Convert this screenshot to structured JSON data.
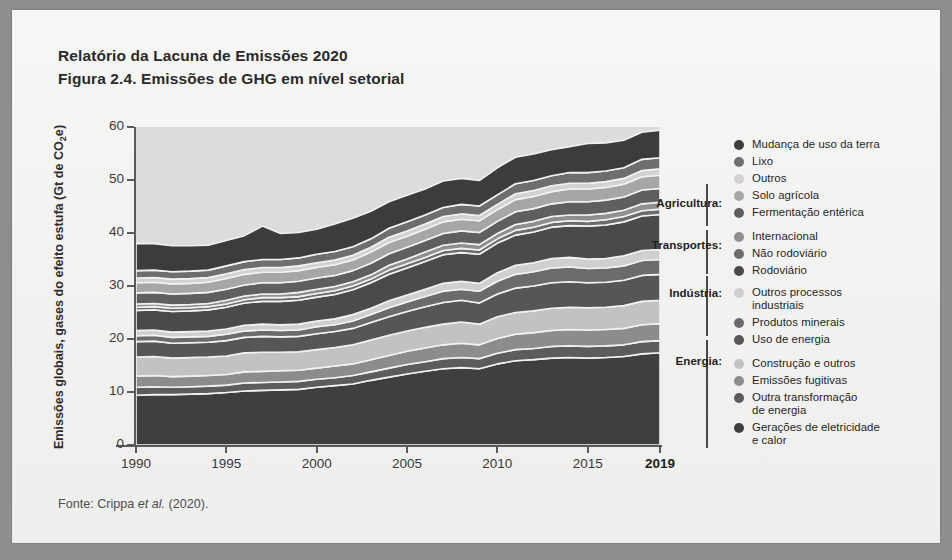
{
  "document": {
    "title_line1": "Relatório da Lacuna de Emissões 2020",
    "title_line2": "Figura 2.4. Emissões de GHG em nível setorial",
    "source_prefix": "Fonte: Crippa ",
    "source_italic": "et al.",
    "source_suffix": " (2020)."
  },
  "axis": {
    "ylabel_main": "Emissões globais, gases do efeito estufa (Gt de CO",
    "ylabel_sub": "2",
    "ylabel_tail": "e)",
    "yticks": [
      "0",
      "10",
      "20",
      "30",
      "40",
      "50",
      "60"
    ],
    "xticks": [
      {
        "label": "1990",
        "bold": false
      },
      {
        "label": "1995",
        "bold": false
      },
      {
        "label": "2000",
        "bold": false
      },
      {
        "label": "2005",
        "bold": false
      },
      {
        "label": "2010",
        "bold": false
      },
      {
        "label": "2015",
        "bold": false
      },
      {
        "label": "2019",
        "bold": true
      }
    ]
  },
  "legend": {
    "groups": [
      {
        "label": "Agricultura:",
        "top": 70,
        "bracket_top": 58,
        "bracket_height": 42
      },
      {
        "label": "Transportes:",
        "top": 112,
        "bracket_top": 104,
        "bracket_height": 44
      },
      {
        "label": "Indústria:",
        "top": 160,
        "bracket_top": 150,
        "bracket_height": 60
      },
      {
        "label": "Energia:",
        "top": 228,
        "bracket_top": 214,
        "bracket_height": 108
      }
    ],
    "items": [
      {
        "label": "Mudança de uso da terra",
        "color": "#3c3c3c",
        "top": 12
      },
      {
        "label": "Lixo",
        "color": "#6e6e6e",
        "top": 29
      },
      {
        "label": "Outros",
        "color": "#d2d2d2",
        "top": 46
      },
      {
        "label": "Solo agrícola",
        "color": "#a6a6a6",
        "top": 63
      },
      {
        "label": "Fermentação entérica",
        "color": "#5f5f5f",
        "top": 80
      },
      {
        "label": "Internacional",
        "color": "#8f8f8f",
        "top": 104
      },
      {
        "label": "Não rodoviário",
        "color": "#6b6b6b",
        "top": 121
      },
      {
        "label": "Rodoviário",
        "color": "#4a4a4a",
        "top": 138
      },
      {
        "label": "Outros processos\nindustriais",
        "color": "#cfcfcf",
        "top": 160
      },
      {
        "label": "Produtos minerais",
        "color": "#6b6b6b",
        "top": 190
      },
      {
        "label": "Uso de energia",
        "color": "#565656",
        "top": 207
      },
      {
        "label": "Construção e outros",
        "color": "#c2c2c2",
        "top": 231
      },
      {
        "label": "Emissões fugitivas",
        "color": "#8c8c8c",
        "top": 248
      },
      {
        "label": "Outra transformação\nde energia",
        "color": "#5c5c5c",
        "top": 265
      },
      {
        "label": "Gerações de eletricidade\ne calor",
        "color": "#3f3f3f",
        "top": 295
      }
    ]
  },
  "chart_data": {
    "type": "area",
    "stacked": true,
    "title": "Figura 2.4. Emissões de GHG em nível setorial",
    "xlabel": "",
    "ylabel": "Emissões globais, gases do efeito estufa (Gt de CO2e)",
    "xlim": [
      1990,
      2019
    ],
    "ylim": [
      0,
      60
    ],
    "ytick_values": [
      0,
      10,
      20,
      30,
      40,
      50,
      60
    ],
    "grid": false,
    "legend_position": "right",
    "x": [
      1990,
      1991,
      1992,
      1993,
      1994,
      1995,
      1996,
      1997,
      1998,
      1999,
      2000,
      2001,
      2002,
      2003,
      2004,
      2005,
      2006,
      2007,
      2008,
      2009,
      2010,
      2011,
      2012,
      2013,
      2014,
      2015,
      2016,
      2017,
      2018,
      2019
    ],
    "series": [
      {
        "name": "Gerações de eletricidade e calor",
        "group": "Energia",
        "color": "#3f3f3f",
        "values": [
          9.4,
          9.5,
          9.5,
          9.6,
          9.7,
          9.9,
          10.2,
          10.3,
          10.4,
          10.5,
          10.9,
          11.2,
          11.5,
          12.2,
          12.8,
          13.4,
          13.9,
          14.4,
          14.6,
          14.4,
          15.3,
          15.9,
          16.1,
          16.4,
          16.5,
          16.4,
          16.5,
          16.7,
          17.2,
          17.4
        ]
      },
      {
        "name": "Outra transformação de energia",
        "group": "Energia",
        "color": "#5c5c5c",
        "values": [
          1.5,
          1.5,
          1.4,
          1.4,
          1.4,
          1.4,
          1.5,
          1.5,
          1.5,
          1.5,
          1.5,
          1.5,
          1.6,
          1.6,
          1.7,
          1.8,
          1.8,
          1.9,
          1.9,
          1.9,
          2.0,
          2.1,
          2.1,
          2.2,
          2.2,
          2.2,
          2.2,
          2.2,
          2.3,
          2.3
        ]
      },
      {
        "name": "Emissões fugitivas",
        "group": "Energia",
        "color": "#8c8c8c",
        "values": [
          2.1,
          2.1,
          2.0,
          2.0,
          2.0,
          2.0,
          2.1,
          2.1,
          2.1,
          2.1,
          2.1,
          2.2,
          2.2,
          2.3,
          2.4,
          2.5,
          2.6,
          2.6,
          2.7,
          2.6,
          2.8,
          2.9,
          3.0,
          3.0,
          3.1,
          3.1,
          3.1,
          3.1,
          3.2,
          3.2
        ]
      },
      {
        "name": "Construção e outros",
        "group": "Energia",
        "color": "#c2c2c2",
        "values": [
          3.6,
          3.6,
          3.5,
          3.5,
          3.5,
          3.5,
          3.6,
          3.6,
          3.5,
          3.5,
          3.5,
          3.5,
          3.6,
          3.7,
          3.8,
          3.8,
          3.9,
          3.9,
          4.0,
          3.9,
          4.1,
          4.1,
          4.1,
          4.2,
          4.2,
          4.2,
          4.2,
          4.3,
          4.4,
          4.4
        ]
      },
      {
        "name": "Uso de energia",
        "group": "Indústria",
        "color": "#565656",
        "values": [
          2.9,
          2.9,
          2.8,
          2.8,
          2.8,
          2.9,
          2.9,
          3.0,
          2.9,
          2.9,
          3.0,
          3.0,
          3.1,
          3.3,
          3.5,
          3.7,
          3.9,
          4.1,
          4.1,
          4.0,
          4.3,
          4.6,
          4.7,
          4.8,
          4.8,
          4.7,
          4.7,
          4.8,
          4.9,
          4.9
        ]
      },
      {
        "name": "Produtos minerais",
        "group": "Indústria",
        "color": "#6b6b6b",
        "values": [
          1.1,
          1.1,
          1.1,
          1.1,
          1.1,
          1.2,
          1.2,
          1.2,
          1.2,
          1.2,
          1.3,
          1.3,
          1.4,
          1.5,
          1.7,
          1.8,
          1.9,
          2.1,
          2.1,
          2.2,
          2.4,
          2.6,
          2.7,
          2.8,
          2.8,
          2.7,
          2.7,
          2.7,
          2.8,
          2.8
        ]
      },
      {
        "name": "Outros processos industriais",
        "group": "Indústria",
        "color": "#cfcfcf",
        "values": [
          1.0,
          1.0,
          1.0,
          1.0,
          1.0,
          1.0,
          1.1,
          1.1,
          1.1,
          1.1,
          1.1,
          1.1,
          1.2,
          1.2,
          1.3,
          1.3,
          1.4,
          1.5,
          1.5,
          1.5,
          1.6,
          1.7,
          1.7,
          1.8,
          1.8,
          1.8,
          1.8,
          1.9,
          1.9,
          1.9
        ]
      },
      {
        "name": "Rodoviário",
        "group": "Transportes",
        "color": "#4a4a4a",
        "values": [
          3.8,
          3.8,
          3.9,
          3.9,
          4.0,
          4.1,
          4.2,
          4.3,
          4.4,
          4.5,
          4.5,
          4.6,
          4.7,
          4.8,
          5.0,
          5.1,
          5.2,
          5.4,
          5.4,
          5.5,
          5.6,
          5.7,
          5.8,
          5.9,
          6.0,
          6.2,
          6.3,
          6.4,
          6.5,
          6.6
        ]
      },
      {
        "name": "Não rodoviário",
        "group": "Transportes",
        "color": "#6b6b6b",
        "values": [
          0.6,
          0.6,
          0.6,
          0.6,
          0.6,
          0.6,
          0.6,
          0.7,
          0.7,
          0.7,
          0.7,
          0.7,
          0.7,
          0.7,
          0.8,
          0.8,
          0.8,
          0.8,
          0.8,
          0.8,
          0.8,
          0.9,
          0.9,
          0.9,
          0.9,
          0.9,
          1.0,
          1.0,
          1.0,
          1.0
        ]
      },
      {
        "name": "Internacional",
        "group": "Transportes",
        "color": "#8f8f8f",
        "values": [
          0.6,
          0.6,
          0.6,
          0.6,
          0.6,
          0.7,
          0.7,
          0.7,
          0.7,
          0.8,
          0.8,
          0.8,
          0.8,
          0.8,
          0.9,
          0.9,
          1.0,
          1.0,
          1.0,
          1.0,
          1.0,
          1.1,
          1.1,
          1.1,
          1.1,
          1.2,
          1.2,
          1.2,
          1.3,
          1.3
        ]
      },
      {
        "name": "Fermentação entérica",
        "group": "Agricultura",
        "color": "#5f5f5f",
        "values": [
          2.1,
          2.1,
          2.1,
          2.1,
          2.1,
          2.1,
          2.1,
          2.1,
          2.1,
          2.1,
          2.1,
          2.1,
          2.1,
          2.2,
          2.2,
          2.2,
          2.2,
          2.2,
          2.3,
          2.3,
          2.3,
          2.4,
          2.4,
          2.4,
          2.5,
          2.5,
          2.5,
          2.5,
          2.6,
          2.6
        ]
      },
      {
        "name": "Solo agrícola",
        "group": "Agricultura",
        "color": "#a6a6a6",
        "values": [
          1.9,
          1.9,
          1.9,
          1.9,
          1.9,
          2.0,
          2.0,
          2.0,
          2.0,
          2.0,
          2.0,
          2.0,
          2.0,
          2.1,
          2.1,
          2.1,
          2.1,
          2.2,
          2.2,
          2.2,
          2.2,
          2.3,
          2.3,
          2.3,
          2.4,
          2.4,
          2.4,
          2.4,
          2.5,
          2.5
        ]
      },
      {
        "name": "Outros",
        "group": "",
        "color": "#d2d2d2",
        "values": [
          0.9,
          0.9,
          0.9,
          0.9,
          0.9,
          0.9,
          0.9,
          0.9,
          0.9,
          0.9,
          0.9,
          0.9,
          0.9,
          0.9,
          1.0,
          1.0,
          1.0,
          1.0,
          1.0,
          1.0,
          1.0,
          1.1,
          1.1,
          1.1,
          1.1,
          1.1,
          1.1,
          1.1,
          1.2,
          1.2
        ]
      },
      {
        "name": "Lixo",
        "group": "",
        "color": "#6e6e6e",
        "values": [
          1.4,
          1.4,
          1.4,
          1.4,
          1.4,
          1.5,
          1.5,
          1.5,
          1.5,
          1.5,
          1.6,
          1.6,
          1.6,
          1.6,
          1.7,
          1.7,
          1.7,
          1.7,
          1.8,
          1.8,
          1.8,
          1.9,
          1.9,
          1.9,
          2.0,
          2.0,
          2.0,
          2.0,
          2.1,
          2.1
        ]
      },
      {
        "name": "Mudança de uso da terra",
        "group": "",
        "color": "#3c3c3c",
        "values": [
          5.1,
          5.0,
          4.9,
          4.8,
          4.7,
          4.8,
          4.9,
          6.3,
          4.9,
          4.8,
          4.7,
          5.2,
          5.4,
          5.2,
          5.0,
          5.0,
          4.9,
          5.0,
          4.9,
          4.8,
          5.1,
          5.0,
          5.0,
          4.9,
          4.9,
          5.5,
          5.3,
          5.2,
          5.1,
          5.2
        ]
      }
    ],
    "totals": [
      37.9,
      37.9,
      37.6,
      37.6,
      37.7,
      38.5,
      39.5,
      41.3,
      40.0,
      40.1,
      40.7,
      41.7,
      42.9,
      44.1,
      45.8,
      47.1,
      48.3,
      49.8,
      50.5,
      50.1,
      52.3,
      54.3,
      55.1,
      55.9,
      56.3,
      56.9,
      57.0,
      57.5,
      58.9,
      59.4
    ]
  }
}
